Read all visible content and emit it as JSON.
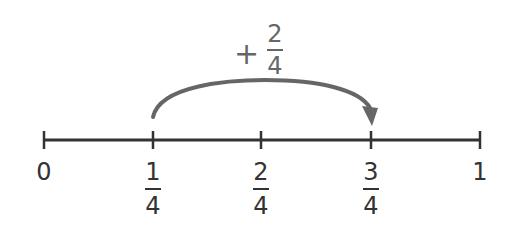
{
  "number_line": {
    "start_label": "0",
    "end_label": "1",
    "ticks": [
      {
        "value": "0"
      },
      {
        "num": "1",
        "den": "4"
      },
      {
        "num": "2",
        "den": "4"
      },
      {
        "num": "3",
        "den": "4"
      },
      {
        "value": "1"
      }
    ]
  },
  "jump": {
    "sign": "+",
    "num": "2",
    "den": "4",
    "from": "1/4",
    "to": "3/4"
  },
  "colors": {
    "line": "#333333",
    "arrow": "#666666"
  }
}
